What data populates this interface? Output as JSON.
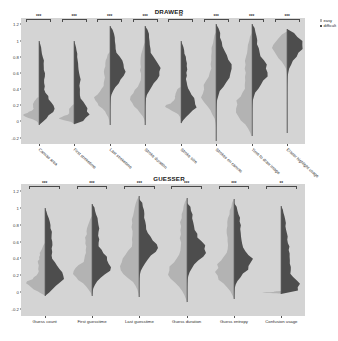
{
  "legend": {
    "position": "top-right",
    "entries": [
      {
        "label": "easy",
        "color": "#b3b3b3"
      },
      {
        "label": "difficult",
        "color": "#4d4d4d"
      }
    ]
  },
  "chart_data": [
    {
      "type": "violin",
      "title": "DRAWER",
      "xlabel": "",
      "ylabel": "",
      "ylim": [
        -0.28,
        1.28
      ],
      "grid": false,
      "yticks": [
        "-0.2",
        "0",
        "0.2",
        "0.4",
        "0.6",
        "0.8",
        "1",
        "1.2"
      ],
      "ytick_values": [
        -0.2,
        0,
        0.2,
        0.4,
        0.6,
        0.8,
        1.0,
        1.2
      ],
      "categories": [
        "Canvas area",
        "First stroketime",
        "Last stroketime",
        "Stroke duration",
        "Stroke size",
        "Strokes on canvas",
        "Time to draw image",
        "Eraser highlight usage"
      ],
      "annotations": [
        "***",
        "***",
        "***",
        "***",
        "**",
        "***",
        "***",
        "***"
      ],
      "series": [
        {
          "name": "easy",
          "color": "#b3b3b3",
          "medians": [
            0.07,
            0.04,
            0.26,
            0.26,
            0.17,
            0.32,
            0.14,
            0.93
          ],
          "ranges": [
            [
              -0.04,
              0.3
            ],
            [
              -0.03,
              0.22
            ],
            [
              -0.05,
              0.86
            ],
            [
              -0.05,
              1.0
            ],
            [
              -0.02,
              0.42
            ],
            [
              -0.22,
              1.12
            ],
            [
              -0.18,
              1.1
            ],
            [
              0.02,
              1.12
            ]
          ]
        },
        {
          "name": "difficult",
          "color": "#4d4d4d",
          "medians": [
            0.15,
            0.07,
            0.62,
            0.6,
            0.2,
            0.63,
            0.6,
            0.97
          ],
          "ranges": [
            [
              -0.04,
              1.0
            ],
            [
              -0.03,
              1.0
            ],
            [
              -0.05,
              1.18
            ],
            [
              -0.05,
              1.18
            ],
            [
              -0.02,
              1.0
            ],
            [
              -0.24,
              1.2
            ],
            [
              -0.1,
              1.2
            ],
            [
              -0.14,
              1.14
            ]
          ]
        }
      ]
    },
    {
      "type": "violin",
      "title": "GUESSER",
      "xlabel": "",
      "ylabel": "",
      "ylim": [
        -0.28,
        1.28
      ],
      "grid": false,
      "yticks": [
        "-0.2",
        "0",
        "0.2",
        "0.4",
        "0.6",
        "0.8",
        "1",
        "1.2"
      ],
      "ytick_values": [
        -0.2,
        0,
        0.2,
        0.4,
        0.6,
        0.8,
        1.0,
        1.2
      ],
      "categories": [
        "Guess count",
        "First guesstime",
        "Last guesstime",
        "Guess duration",
        "Guess entropy",
        "Confusion usage"
      ],
      "annotations": [
        "***",
        "***",
        "***",
        "***",
        "***",
        "**"
      ],
      "series": [
        {
          "name": "easy",
          "color": "#b3b3b3",
          "medians": [
            0.08,
            0.2,
            0.3,
            0.22,
            0.21,
            0.0
          ],
          "ranges": [
            [
              -0.04,
              0.58
            ],
            [
              -0.04,
              0.9
            ],
            [
              -0.06,
              1.14
            ],
            [
              -0.12,
              1.12
            ],
            [
              -0.08,
              1.1
            ],
            [
              -0.02,
              0.02
            ]
          ]
        },
        {
          "name": "difficult",
          "color": "#4d4d4d",
          "medians": [
            0.16,
            0.3,
            0.52,
            0.5,
            0.36,
            0.0
          ],
          "ranges": [
            [
              -0.04,
              1.0
            ],
            [
              -0.04,
              1.04
            ],
            [
              -0.06,
              1.1
            ],
            [
              -0.12,
              1.06
            ],
            [
              -0.08,
              1.06
            ],
            [
              -0.02,
              1.02
            ]
          ]
        }
      ]
    }
  ]
}
